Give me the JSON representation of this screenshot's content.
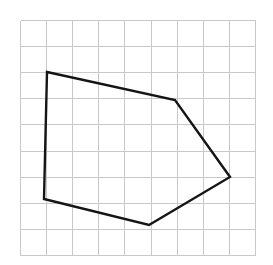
{
  "figure": {
    "title": "Irregular pentagon drawn on a square grid",
    "width": 273,
    "height": 265,
    "background_color": "#ffffff"
  },
  "chart_data": {
    "type": "scatter",
    "title": "Irregular pentagon drawn on a square grid",
    "subtitle": "",
    "xlabel": "",
    "ylabel": "",
    "grid": true,
    "legend": null,
    "legend_position": "none",
    "xlim": [
      0,
      9
    ],
    "ylim": [
      0,
      9
    ],
    "axis_tick_labels": {
      "x": [],
      "y": []
    },
    "grid_spec": {
      "origin_px": [
        20,
        20
      ],
      "cell_size_px": 26.1,
      "columns": 9,
      "rows": 9,
      "line_color": "#c9c9c9",
      "line_width_px": 1
    },
    "series": [
      {
        "name": "pentagon",
        "shape": "polygon",
        "closed": true,
        "stroke_color": "#151515",
        "stroke_width_px": 2.4,
        "fill_color": "none",
        "vertices_px": [
          [
            47,
            72
          ],
          [
            175,
            100
          ],
          [
            230,
            177
          ],
          [
            149,
            225
          ],
          [
            44,
            199
          ]
        ],
        "vertices_grid": [
          [
            1.03,
            1.99
          ],
          [
            5.94,
            3.07
          ],
          [
            8.05,
            6.02
          ],
          [
            4.94,
            7.85
          ],
          [
            0.92,
            6.86
          ]
        ],
        "vertex_count": 5
      }
    ],
    "annotations": []
  }
}
